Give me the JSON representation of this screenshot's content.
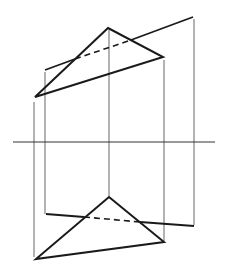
{
  "diagram": {
    "width": 226,
    "height": 271,
    "colors": {
      "stroke": "#1a1a1a",
      "projector": "#555555",
      "background": "#ffffff"
    },
    "axis": {
      "x1": 13,
      "y1": 142,
      "x2": 215,
      "y2": 142
    },
    "top_view": {
      "triangle": [
        [
          108,
          28
        ],
        [
          163,
          57
        ],
        [
          35,
          97
        ]
      ],
      "line": {
        "x1": 45,
        "y1": 70,
        "x2": 193,
        "y2": 17
      },
      "hidden_segment": {
        "x1": 75,
        "y1": 59,
        "x2": 131,
        "y2": 40
      }
    },
    "bottom_view": {
      "triangle": [
        [
          109,
          197
        ],
        [
          164,
          242
        ],
        [
          36,
          259
        ]
      ],
      "line": {
        "x1": 46,
        "y1": 214,
        "x2": 194,
        "y2": 226
      },
      "hidden_segment": {
        "x1": 84,
        "y1": 217,
        "x2": 140,
        "y2": 222
      }
    },
    "projectors": [
      {
        "x": 34,
        "y1": 102,
        "y2": 257
      },
      {
        "x": 45,
        "y1": 72,
        "y2": 214
      },
      {
        "x": 109,
        "y1": 30,
        "y2": 196
      },
      {
        "x": 164,
        "y1": 60,
        "y2": 241
      },
      {
        "x": 194,
        "y1": 19,
        "y2": 225
      }
    ]
  }
}
